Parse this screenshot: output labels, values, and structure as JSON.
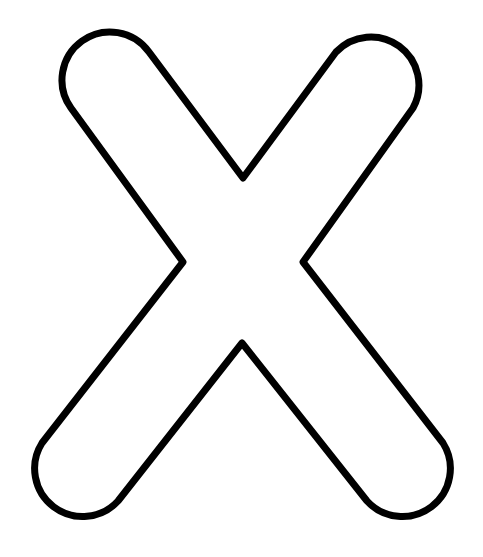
{
  "image": {
    "subject": "Outlined letter X",
    "letter": "X",
    "colors": {
      "background": "#ffffff",
      "fill": "#ffffff",
      "outline": "#000000"
    },
    "outline_width": 7
  }
}
